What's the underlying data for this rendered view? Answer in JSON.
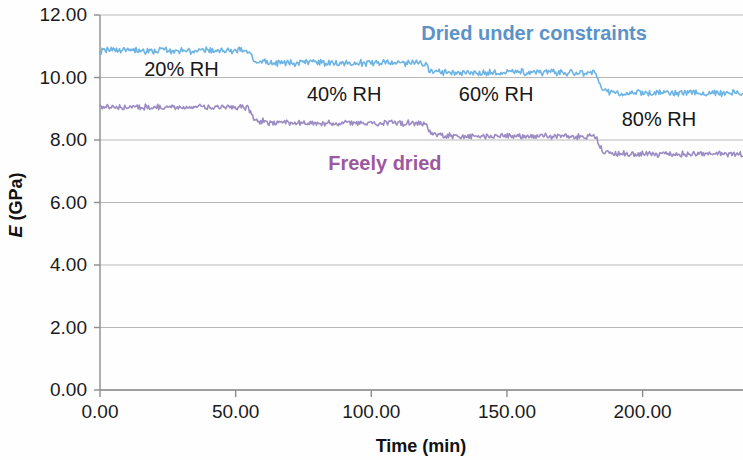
{
  "chart_data": {
    "type": "line",
    "title": "",
    "xlabel": "Time (min)",
    "ylabel": "E (GPa)",
    "ylabel_italic_part": "E",
    "ylabel_rest_part": " (GPa)",
    "xlim": [
      0,
      237
    ],
    "ylim": [
      0,
      12
    ],
    "xticks": [
      0,
      50,
      100,
      150,
      200
    ],
    "xtick_labels": [
      "0.00",
      "50.00",
      "100.00",
      "150.00",
      "200.00"
    ],
    "yticks": [
      0,
      2,
      4,
      6,
      8,
      10,
      12
    ],
    "ytick_labels": [
      "0.00",
      "2.00",
      "4.00",
      "6.00",
      "8.00",
      "10.00",
      "12.00"
    ],
    "grid": "horizontal",
    "legend_position": "inline-annotations",
    "annotations": [
      {
        "text": "20% RH",
        "x": 30,
        "y": 10.05,
        "color": "#171717"
      },
      {
        "text": "40% RH",
        "x": 90,
        "y": 9.25,
        "color": "#171717"
      },
      {
        "text": "60% RH",
        "x": 146,
        "y": 9.25,
        "color": "#171717"
      },
      {
        "text": "80% RH",
        "x": 206,
        "y": 8.45,
        "color": "#171717"
      },
      {
        "text": "Dried under constraints",
        "x": 160,
        "y": 11.2,
        "color": "#5B93C9"
      },
      {
        "text": "Freely dried",
        "x": 105,
        "y": 7.05,
        "color": "#9C59A0"
      }
    ],
    "series": [
      {
        "name": "Dried under constraints",
        "color": "#6CB4E4",
        "label_color": "#5B93C9",
        "steps": [
          {
            "from": 0,
            "to": 55,
            "level": 10.86
          },
          {
            "from": 55,
            "to": 120,
            "level": 10.46
          },
          {
            "from": 120,
            "to": 183,
            "level": 10.16
          },
          {
            "from": 183,
            "to": 237,
            "level": 9.5
          }
        ],
        "noise_amplitude": 0.09
      },
      {
        "name": "Freely dried",
        "color": "#9B8CC4",
        "label_color": "#9C59A0",
        "steps": [
          {
            "from": 0,
            "to": 55,
            "level": 9.05
          },
          {
            "from": 55,
            "to": 120,
            "level": 8.55
          },
          {
            "from": 120,
            "to": 183,
            "level": 8.12
          },
          {
            "from": 183,
            "to": 237,
            "level": 7.55
          }
        ],
        "noise_amplitude": 0.08
      }
    ]
  },
  "axes_colors": {
    "grid": "#b9b9b9",
    "axis": "#8d8d8d",
    "tick_text": "#1b1b1b"
  }
}
